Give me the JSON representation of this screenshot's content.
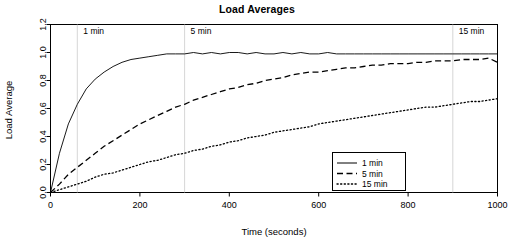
{
  "chart_data": {
    "type": "line",
    "title": "Load Averages",
    "xlabel": "Time (seconds)",
    "ylabel": "Load Average",
    "xlim": [
      0,
      1000
    ],
    "ylim": [
      0.0,
      1.2
    ],
    "xticks": [
      "0",
      "200",
      "400",
      "600",
      "800",
      "1000"
    ],
    "xtick_values": [
      0,
      200,
      400,
      600,
      800,
      1000
    ],
    "yticks": [
      "0.0",
      "0.2",
      "0.4",
      "0.6",
      "0.8",
      "1.0",
      "1.2"
    ],
    "ytick_values": [
      0.0,
      0.2,
      0.4,
      0.6,
      0.8,
      1.0,
      1.2
    ],
    "grid": false,
    "legend_position": "bottom-right",
    "x": [
      0,
      20,
      40,
      60,
      80,
      100,
      120,
      140,
      160,
      180,
      200,
      220,
      240,
      260,
      280,
      300,
      320,
      340,
      360,
      380,
      400,
      420,
      440,
      460,
      480,
      500,
      520,
      540,
      560,
      580,
      600,
      620,
      640,
      660,
      680,
      700,
      720,
      740,
      760,
      780,
      800,
      820,
      840,
      860,
      880,
      900,
      920,
      940,
      960,
      980,
      1000
    ],
    "series": [
      {
        "name": "1 min",
        "linestyle": "solid",
        "tau": 60,
        "color": "#000000",
        "values": [
          0.0,
          0.28,
          0.49,
          0.63,
          0.74,
          0.81,
          0.86,
          0.9,
          0.93,
          0.95,
          0.96,
          0.97,
          0.98,
          0.99,
          0.99,
          0.99,
          1.0,
          0.99,
          1.0,
          0.99,
          1.0,
          1.0,
          0.99,
          1.0,
          0.99,
          0.99,
          1.0,
          0.99,
          1.0,
          0.99,
          0.99,
          1.0,
          0.99,
          0.99,
          0.99,
          0.99,
          0.99,
          0.99,
          0.99,
          0.99,
          0.99,
          0.99,
          0.99,
          0.99,
          0.99,
          0.99,
          0.99,
          0.99,
          0.99,
          0.99,
          0.99
        ]
      },
      {
        "name": "5 min",
        "linestyle": "dashed",
        "tau": 300,
        "color": "#000000",
        "values": [
          0.0,
          0.06,
          0.13,
          0.18,
          0.23,
          0.28,
          0.33,
          0.37,
          0.41,
          0.45,
          0.49,
          0.52,
          0.55,
          0.58,
          0.61,
          0.63,
          0.66,
          0.68,
          0.7,
          0.72,
          0.74,
          0.75,
          0.77,
          0.78,
          0.8,
          0.81,
          0.82,
          0.84,
          0.85,
          0.86,
          0.86,
          0.87,
          0.88,
          0.89,
          0.89,
          0.9,
          0.91,
          0.91,
          0.92,
          0.92,
          0.92,
          0.93,
          0.93,
          0.94,
          0.94,
          0.94,
          0.95,
          0.95,
          0.95,
          0.96,
          0.93
        ]
      },
      {
        "name": "15 min",
        "linestyle": "dotted",
        "tau": 900,
        "color": "#000000",
        "values": [
          0.0,
          0.02,
          0.04,
          0.06,
          0.08,
          0.11,
          0.13,
          0.14,
          0.16,
          0.18,
          0.2,
          0.22,
          0.23,
          0.25,
          0.27,
          0.28,
          0.3,
          0.31,
          0.33,
          0.34,
          0.36,
          0.37,
          0.39,
          0.4,
          0.41,
          0.43,
          0.44,
          0.45,
          0.46,
          0.47,
          0.49,
          0.5,
          0.51,
          0.52,
          0.53,
          0.54,
          0.55,
          0.56,
          0.57,
          0.58,
          0.59,
          0.6,
          0.61,
          0.61,
          0.62,
          0.63,
          0.64,
          0.65,
          0.65,
          0.66,
          0.67
        ]
      }
    ],
    "annotations": [
      {
        "label": "1 min",
        "x": 60,
        "y": 1.13
      },
      {
        "label": "5 min",
        "x": 300,
        "y": 1.13
      },
      {
        "label": "15 min",
        "x": 900,
        "y": 1.13
      }
    ],
    "legend_entries": [
      {
        "label": "1 min",
        "linestyle": "solid"
      },
      {
        "label": "5 min",
        "linestyle": "dashed"
      },
      {
        "label": "15 min",
        "linestyle": "dotted"
      }
    ]
  }
}
